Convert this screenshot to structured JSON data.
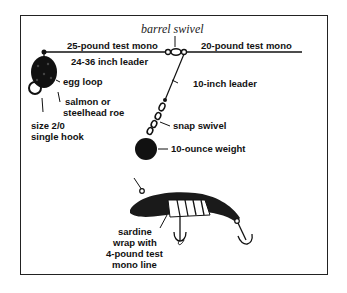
{
  "diagram": {
    "title": "barrel swivel",
    "labels": {
      "main_line_left": "25-pound test mono",
      "main_line_right": "20-pound test mono",
      "leader_long": "24-36 inch leader",
      "egg_loop": "egg loop",
      "roe_line1": "salmon or",
      "roe_line2": "steelhead roe",
      "hook_line1": "size 2/0",
      "hook_line2": "single hook",
      "leader_short": "10-inch leader",
      "snap_swivel": "snap swivel",
      "weight": "10-ounce weight",
      "sardine_line1": "sardine",
      "sardine_line2": "wrap with",
      "sardine_line3": "4-pound test",
      "sardine_line4": "mono line"
    },
    "colors": {
      "ink": "#111111",
      "frame": "#222222",
      "background": "#ffffff"
    }
  }
}
